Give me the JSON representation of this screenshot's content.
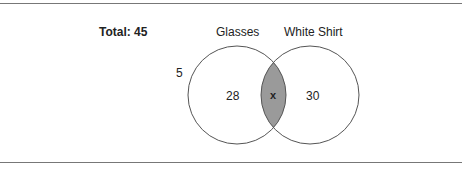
{
  "title": "Total: 45",
  "sets": [
    {
      "name": "Glasses",
      "only_value": "28"
    },
    {
      "name": "White Shirt",
      "only_value": "30"
    }
  ],
  "intersection_label": "x",
  "outside_value": "5",
  "colors": {
    "intersection_fill": "#9a9a9a",
    "stroke": "#555555",
    "rule": "#777777"
  }
}
